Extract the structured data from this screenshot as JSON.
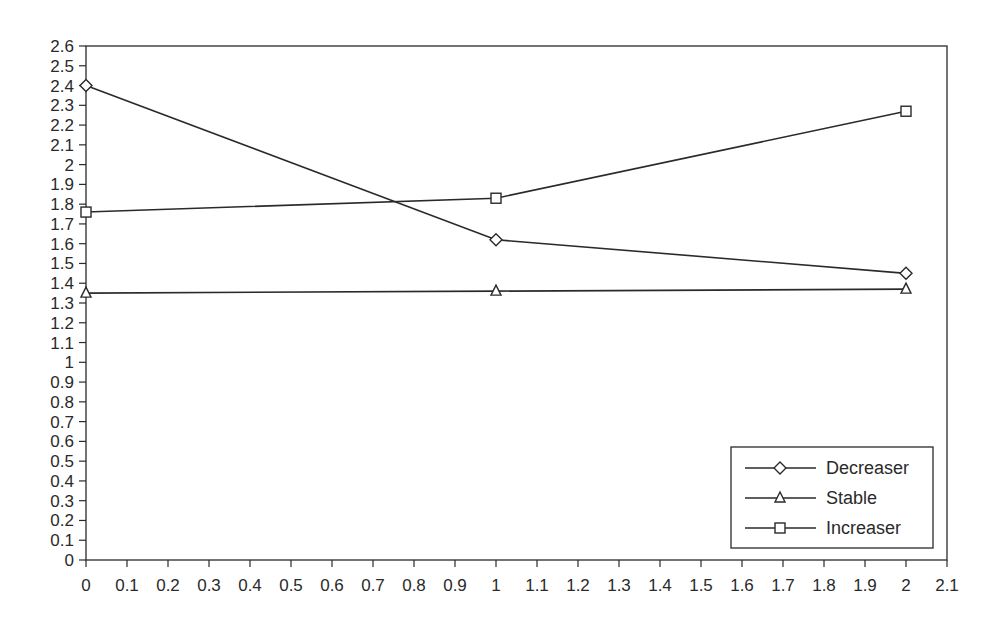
{
  "chart_data": {
    "type": "line",
    "title": "",
    "xlabel": "",
    "ylabel": "",
    "xlim": [
      0,
      2.1
    ],
    "ylim": [
      0,
      2.6
    ],
    "grid": false,
    "legend_position": "lower right",
    "x_ticks": [
      "0",
      "0.1",
      "0.2",
      "0.3",
      "0.4",
      "0.5",
      "0.6",
      "0.7",
      "0.8",
      "0.9",
      "1",
      "1.1",
      "1.2",
      "1.3",
      "1.4",
      "1.5",
      "1.6",
      "1.7",
      "1.8",
      "1.9",
      "2",
      "2.1"
    ],
    "y_ticks": [
      "0",
      "0.1",
      "0.2",
      "0.3",
      "0.4",
      "0.5",
      "0.6",
      "0.7",
      "0.8",
      "0.9",
      "1",
      "1.1",
      "1.2",
      "1.3",
      "1.4",
      "1.5",
      "1.6",
      "1.7",
      "1.8",
      "1.9",
      "2",
      "2.1",
      "2.2",
      "2.3",
      "2.4",
      "2.5",
      "2.6"
    ],
    "x": [
      0,
      1,
      2
    ],
    "series": [
      {
        "name": "Decreaser",
        "marker": "diamond",
        "values": [
          2.4,
          1.62,
          1.45
        ]
      },
      {
        "name": "Stable",
        "marker": "triangle",
        "values": [
          1.35,
          1.36,
          1.37
        ]
      },
      {
        "name": "Increaser",
        "marker": "square",
        "values": [
          1.76,
          1.83,
          2.27
        ]
      }
    ],
    "colors": {
      "line": "#2a2a2a",
      "marker_fill": "#ffffff",
      "background": "#ffffff"
    }
  }
}
